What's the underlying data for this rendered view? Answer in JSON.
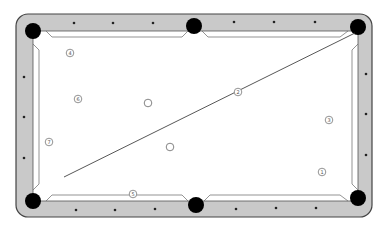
{
  "diagram": {
    "type": "pool-table-shot-diagram",
    "colors": {
      "rail": "#c9c9c9",
      "rail_stroke": "#555555",
      "felt": "#ffffff",
      "pocket": "#000000",
      "diamond": "#222222",
      "ball_stroke": "#777777",
      "aim_line": "#444444"
    },
    "pockets": [
      {
        "name": "top-left-pocket",
        "x": 33,
        "y": 31
      },
      {
        "name": "top-center-pocket",
        "x": 194,
        "y": 26
      },
      {
        "name": "top-right-pocket",
        "x": 358,
        "y": 27
      },
      {
        "name": "bottom-left-pocket",
        "x": 33,
        "y": 201
      },
      {
        "name": "bottom-center-pocket",
        "x": 196,
        "y": 205
      },
      {
        "name": "bottom-right-pocket",
        "x": 358,
        "y": 198
      }
    ],
    "balls": [
      {
        "label": "4",
        "x": 70,
        "y": 53
      },
      {
        "label": "6",
        "x": 78,
        "y": 99
      },
      {
        "label": "7",
        "x": 49,
        "y": 142
      },
      {
        "label": "2",
        "x": 238,
        "y": 92
      },
      {
        "label": "3",
        "x": 329,
        "y": 120
      },
      {
        "label": "1",
        "x": 322,
        "y": 172
      },
      {
        "label": "5",
        "x": 133,
        "y": 194
      }
    ],
    "cue_balls": [
      {
        "name": "white-ball-upper",
        "x": 148,
        "y": 103
      },
      {
        "name": "white-ball-lower",
        "x": 170,
        "y": 147
      }
    ],
    "aim_line": {
      "x1": 64,
      "y1": 177,
      "x2": 355,
      "y2": 33
    }
  }
}
